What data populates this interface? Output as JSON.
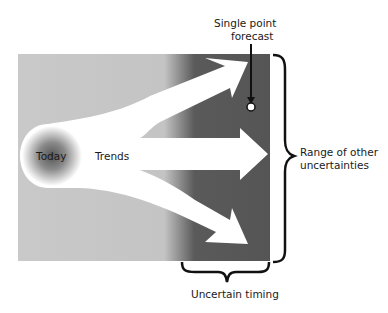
{
  "diagram": {
    "labels": {
      "today": "Today",
      "trends": "Trends",
      "single_point_forecast_line1": "Single point",
      "single_point_forecast_line2": "forecast",
      "range_line1": "Range of other",
      "range_line2": "uncertainties",
      "uncertain_timing": "Uncertain timing"
    },
    "colors": {
      "background": "#ffffff",
      "light_region": "#c8c8c8",
      "dark_region": "#555555",
      "arrows": "#ffffff",
      "today_center": "#5a5a5a",
      "text": "#1a1a1a"
    },
    "arrows": [
      "upward-trend",
      "flat-trend",
      "downward-trend"
    ]
  }
}
